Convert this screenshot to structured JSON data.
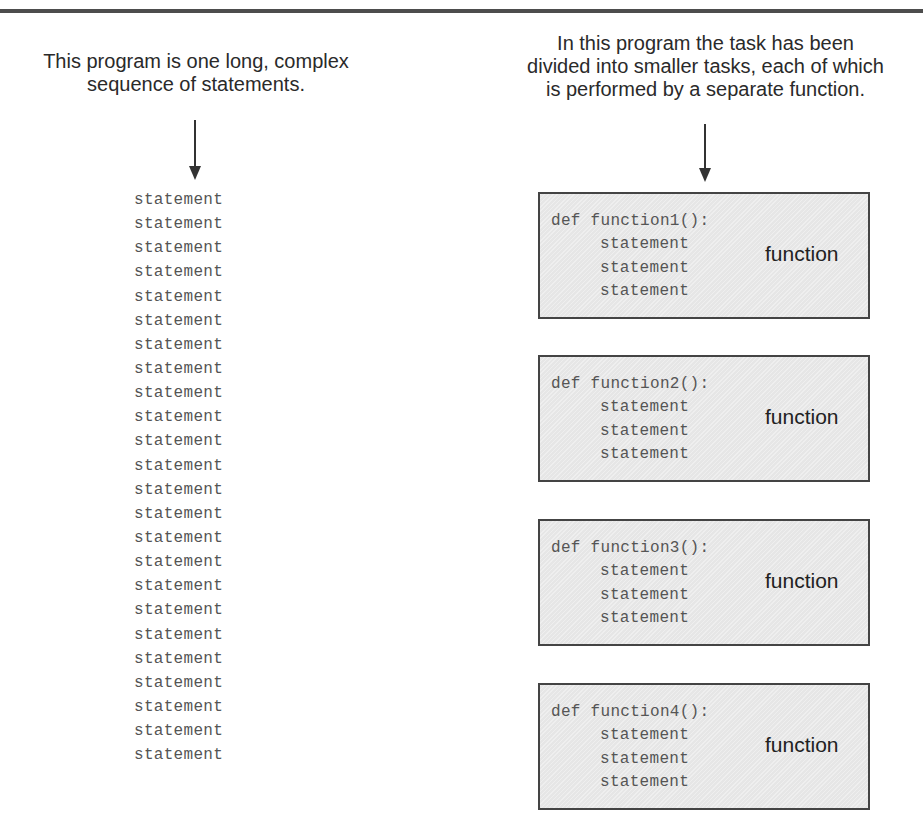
{
  "captions": {
    "left": "This program is one long, complex\nsequence of statements.",
    "right": "In this program the task has been\ndivided into smaller tasks, each of which\nis performed by a separate function."
  },
  "monolithic_program": {
    "statements": [
      "statement",
      "statement",
      "statement",
      "statement",
      "statement",
      "statement",
      "statement",
      "statement",
      "statement",
      "statement",
      "statement",
      "statement",
      "statement",
      "statement",
      "statement",
      "statement",
      "statement",
      "statement",
      "statement",
      "statement",
      "statement",
      "statement",
      "statement",
      "statement"
    ]
  },
  "functions": [
    {
      "def_line": "def function1():",
      "statements": [
        "statement",
        "statement",
        "statement"
      ],
      "label": "function"
    },
    {
      "def_line": "def function2():",
      "statements": [
        "statement",
        "statement",
        "statement"
      ],
      "label": "function"
    },
    {
      "def_line": "def function3():",
      "statements": [
        "statement",
        "statement",
        "statement"
      ],
      "label": "function"
    },
    {
      "def_line": "def function4():",
      "statements": [
        "statement",
        "statement",
        "statement"
      ],
      "label": "function"
    }
  ],
  "colors": {
    "rule": "#4d4d4d",
    "box_fill": "#e6e6e6",
    "box_border": "#444444",
    "code_text": "#555555",
    "caption_text": "#2a2a2a"
  }
}
